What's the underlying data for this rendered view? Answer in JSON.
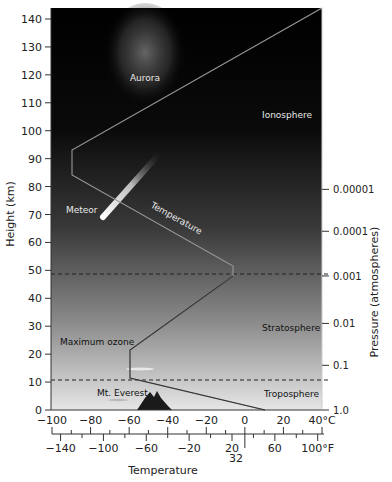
{
  "chart_data": {
    "type": "line",
    "title": "",
    "ylabel": "Height (km)",
    "ylabel_right": "Pressure (atmospheres)",
    "xlabel": "Temperature",
    "ylim": [
      0,
      145
    ],
    "y_ticks": [
      0,
      10,
      20,
      30,
      40,
      50,
      60,
      70,
      80,
      90,
      100,
      110,
      120,
      130,
      140
    ],
    "x_ticks_celsius": [
      "-100",
      "-80",
      "-60",
      "-40",
      "-20",
      "0",
      "20",
      "40°C"
    ],
    "x_ticks_fahrenheit": [
      "-140",
      "-100",
      "-60",
      "-20",
      "20",
      "32",
      "60",
      "100°F"
    ],
    "pressure_ticks": [
      {
        "label": "1.0",
        "height_km": 0
      },
      {
        "label": "0.1",
        "height_km": 16
      },
      {
        "label": "0.01",
        "height_km": 31
      },
      {
        "label": "0.001",
        "height_km": 48
      },
      {
        "label": "0.0001",
        "height_km": 64
      },
      {
        "label": "0.00001",
        "height_km": 79
      }
    ],
    "series": [
      {
        "name": "Temperature",
        "points_celsius_vs_km": [
          [
            15,
            0
          ],
          [
            -56,
            11
          ],
          [
            -56,
            21
          ],
          [
            -2,
            48
          ],
          [
            -2,
            52
          ],
          [
            -86,
            84
          ],
          [
            -86,
            93
          ],
          [
            40,
            145
          ]
        ]
      }
    ],
    "boundaries_km": [
      11,
      48
    ],
    "annotations": [
      "Aurora",
      "Ionosphere",
      "Meteor",
      "Temperature",
      "Maximum ozone",
      "Stratosphere",
      "Mt. Everest",
      "Troposphere"
    ],
    "grid": false
  },
  "labels": {
    "y_axis_title": "Height (km)",
    "y2_axis_title": "Pressure (atmospheres)",
    "x_axis_title": "Temperature",
    "aurora": "Aurora",
    "ionosphere": "Ionosphere",
    "meteor": "Meteor",
    "temperature_line": "Temperature",
    "max_ozone": "Maximum ozone",
    "stratosphere": "Stratosphere",
    "everest": "Mt. Everest",
    "troposphere": "Troposphere"
  },
  "y_ticks": [
    "0",
    "10",
    "20",
    "30",
    "40",
    "50",
    "60",
    "70",
    "80",
    "90",
    "100",
    "110",
    "120",
    "130",
    "140"
  ],
  "celsius_ticks": [
    "−100",
    "−80",
    "−60",
    "−40",
    "−20",
    "0",
    "20",
    "40°C"
  ],
  "fahrenheit_ticks": [
    "−140",
    "−100",
    "−60",
    "−20",
    "20",
    "60",
    "100°F"
  ],
  "fahrenheit_32": "32",
  "pressure_ticks": [
    "1.0",
    "0.1",
    "0.01",
    "0.001",
    "0.0001",
    "0.00001"
  ]
}
